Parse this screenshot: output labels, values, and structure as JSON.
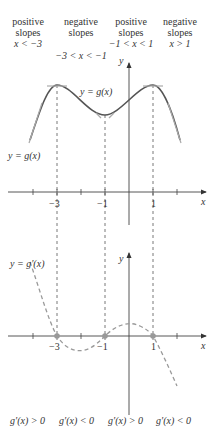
{
  "headers": [
    {
      "line1": "positive",
      "line2": "slopes",
      "cond": "x < −3"
    },
    {
      "line1": "negative",
      "line2": "slopes",
      "cond": "−3 < x < −1"
    },
    {
      "line1": "positive",
      "line2": "slopes",
      "cond": "−1 < x < 1"
    },
    {
      "line1": "negative",
      "line2": "slopes",
      "cond": "x > 1"
    }
  ],
  "top_graph": {
    "curve_label": "y = g(x)",
    "curve_label_left": "y = g(x)",
    "y_axis_label": "y",
    "x_axis_label": "x",
    "tick_labels": [
      "−3",
      "−1",
      "1"
    ]
  },
  "bottom_graph": {
    "curve_label": "y = g′(x)",
    "y_axis_label": "y",
    "x_axis_label": "x",
    "tick_labels": [
      "−3",
      "−1",
      "1"
    ]
  },
  "footer": [
    "g′(x) > 0",
    "g′(x) < 0",
    "g′(x) > 0",
    "g′(x) < 0"
  ],
  "colors": {
    "curve": "#555555",
    "tangent": "#999999",
    "derivative_dashed": "#999999",
    "axis": "#444444",
    "dot": "#999999"
  }
}
